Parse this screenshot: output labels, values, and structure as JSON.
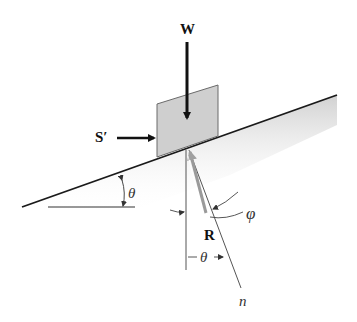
{
  "diagram": {
    "title": "",
    "labels": {
      "weight": "W",
      "force": "S′",
      "reaction": "R",
      "incline_angle": "θ",
      "reaction_angle_theta": "θ",
      "friction_angle": "φ",
      "normal": "n"
    },
    "colors": {
      "block_fill": "#cfcfcf",
      "line": "#1a1a1a",
      "reaction": "#9a9a9a",
      "shadow": "#c8c8c8"
    }
  }
}
